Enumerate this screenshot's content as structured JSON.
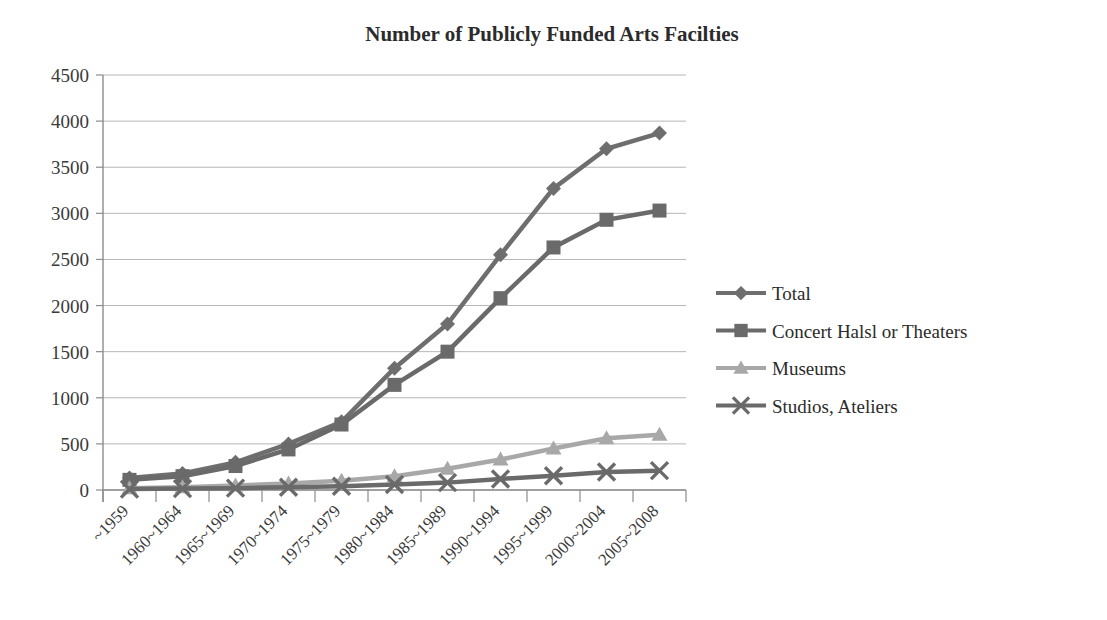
{
  "chart_data": {
    "type": "line",
    "title": "Number of Publicly Funded Arts Facilties",
    "xlabel": "",
    "ylabel": "",
    "ylim": [
      0,
      4500
    ],
    "ytick_step": 500,
    "yticks": [
      "0",
      "500",
      "1000",
      "1500",
      "2000",
      "2500",
      "3000",
      "3500",
      "4000",
      "4500"
    ],
    "grid": "horizontal",
    "legend_position": "right",
    "categories": [
      "~1959",
      "1960~1964",
      "1965~1969",
      "1970~1974",
      "1975~1979",
      "1980~1984",
      "1985~1989",
      "1990~1994",
      "1995~1999",
      "2000~2004",
      "2005~2008"
    ],
    "series": [
      {
        "name": "Total",
        "marker": "diamond",
        "color": "#6e6e6e",
        "values": [
          130,
          180,
          300,
          500,
          740,
          1320,
          1800,
          2550,
          3270,
          3700,
          3870
        ]
      },
      {
        "name": "Concert Halsl or Theaters",
        "marker": "square",
        "color": "#6a6a6a",
        "values": [
          110,
          150,
          260,
          440,
          710,
          1140,
          1500,
          2080,
          2630,
          2930,
          3030
        ]
      },
      {
        "name": "Museums",
        "marker": "triangle",
        "color": "#a8a8a8",
        "values": [
          20,
          30,
          50,
          70,
          100,
          150,
          230,
          330,
          450,
          560,
          600
        ]
      },
      {
        "name": "Studios, Ateliers",
        "marker": "cross",
        "color": "#6a6a6a",
        "values": [
          10,
          15,
          20,
          30,
          40,
          60,
          80,
          120,
          155,
          195,
          210
        ]
      }
    ]
  },
  "legend": {
    "items": [
      {
        "label": "Total"
      },
      {
        "label": "Concert Halsl or Theaters"
      },
      {
        "label": "Museums"
      },
      {
        "label": "Studios, Ateliers"
      }
    ]
  }
}
